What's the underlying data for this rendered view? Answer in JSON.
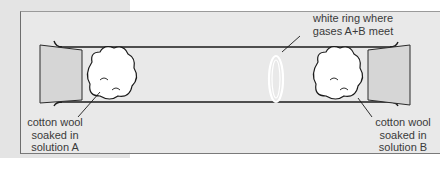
{
  "diagram": {
    "labels": {
      "ring": [
        "white ring where",
        "gases A+B meet"
      ],
      "left_wool": [
        "cotton wool",
        "soaked in",
        "solution A"
      ],
      "right_wool": [
        "cotton wool",
        "soaked in",
        "solution B"
      ]
    },
    "components": [
      "glass tube",
      "left stopper",
      "right stopper",
      "cotton wool A",
      "cotton wool B",
      "white ring"
    ],
    "colors": {
      "background": "#e9e9e9",
      "outline": "#1a1a1a",
      "stopper_fill": "#d6d6d6",
      "wool_fill": "#ffffff",
      "text": "#3a3a3a"
    }
  }
}
